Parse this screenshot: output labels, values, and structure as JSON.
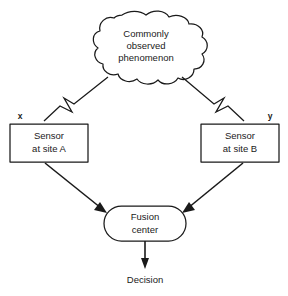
{
  "figure": {
    "type": "block-diagram",
    "background_color": "#ffffff",
    "line_color": "#1a1a1a"
  },
  "nodes": {
    "phenomenon": {
      "shape": "cloud",
      "line1": "Commonly",
      "line2": "observed",
      "line3": "phenomenon"
    },
    "sensor_a": {
      "shape": "rectangle",
      "line1": "Sensor",
      "line2": "at site A"
    },
    "sensor_b": {
      "shape": "rectangle",
      "line1": "Sensor",
      "line2": "at site B"
    },
    "fusion_center": {
      "shape": "stadium",
      "line1": "Fusion",
      "line2": "center"
    }
  },
  "labels": {
    "signal_x": "x",
    "signal_y": "y",
    "decision": "Decision"
  },
  "edges": [
    {
      "id": "phenomenon-to-sensor-a",
      "style": "lightning-bolt",
      "from": "phenomenon",
      "to": "sensor_a",
      "arrowhead": false
    },
    {
      "id": "phenomenon-to-sensor-b",
      "style": "lightning-bolt",
      "from": "phenomenon",
      "to": "sensor_b",
      "arrowhead": false
    },
    {
      "id": "sensor-a-to-fusion-center",
      "style": "straight-arrow",
      "from": "sensor_a",
      "to": "fusion_center",
      "arrowhead": true
    },
    {
      "id": "sensor-b-to-fusion-center",
      "style": "straight-arrow",
      "from": "sensor_b",
      "to": "fusion_center",
      "arrowhead": true
    },
    {
      "id": "fusion-center-to-decision",
      "style": "straight-arrow",
      "from": "fusion_center",
      "to": "decision",
      "arrowhead": true
    }
  ]
}
